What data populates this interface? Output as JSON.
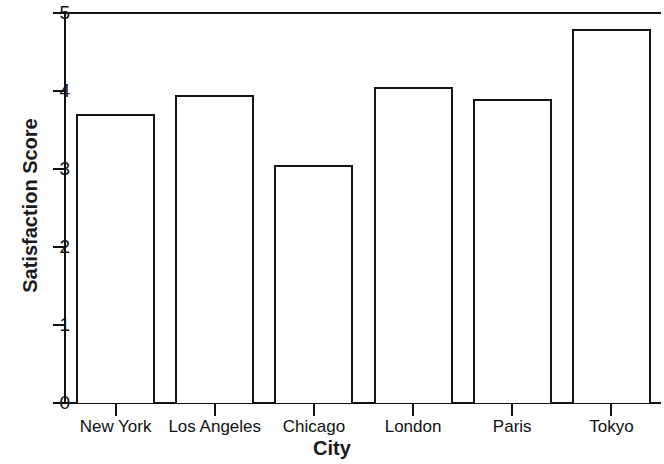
{
  "chart_data": {
    "type": "bar",
    "title": "",
    "xlabel": "City",
    "ylabel": "Satisfaction Score",
    "categories": [
      "New York",
      "Los Angeles",
      "Chicago",
      "London",
      "Paris",
      "Tokyo"
    ],
    "values": [
      3.7,
      3.95,
      3.05,
      4.05,
      3.9,
      4.8
    ],
    "ylim": [
      0,
      5
    ],
    "yticks": [
      0,
      1,
      2,
      3,
      4,
      5
    ],
    "ytick_labels": [
      "0",
      "1",
      "2",
      "3",
      "4",
      "5"
    ],
    "grid": false,
    "legend": false,
    "bar_fill_color": "#ffffff",
    "bar_edge_color": "#141414",
    "axis_color": "#111111"
  },
  "axes": {
    "y_title": "Satisfaction Score",
    "x_title": "City"
  },
  "ticks": {
    "y": [
      {
        "label": "5",
        "value": 5
      },
      {
        "label": "4",
        "value": 4
      },
      {
        "label": "3",
        "value": 3
      },
      {
        "label": "2",
        "value": 2
      },
      {
        "label": "1",
        "value": 1
      },
      {
        "label": "0",
        "value": 0
      }
    ],
    "x": [
      {
        "label": "New York"
      },
      {
        "label": "Los Angeles"
      },
      {
        "label": "Chicago"
      },
      {
        "label": "London"
      },
      {
        "label": "Paris"
      },
      {
        "label": "Tokyo"
      }
    ]
  }
}
